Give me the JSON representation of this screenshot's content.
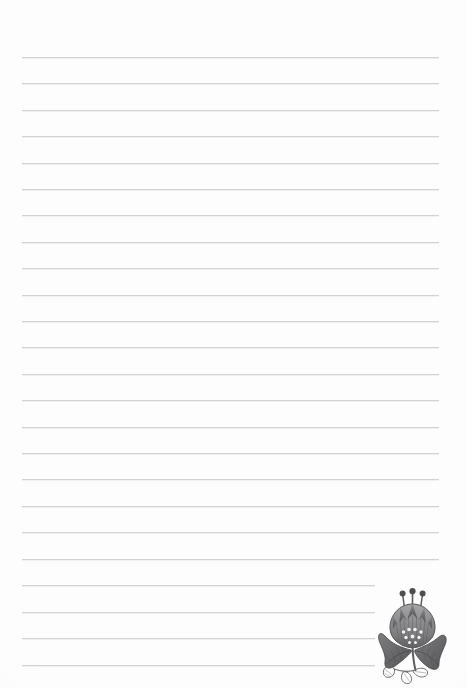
{
  "document": {
    "kind": "lined-notebook-paper",
    "title": "Lined Writing Paper",
    "background_color": "#fdfdfd",
    "width": 467,
    "height": 689
  },
  "rules": {
    "name": "horizontal-ruled-lines",
    "count": 24,
    "color": "#c9cbcd",
    "thickness": 1,
    "first_line_y": 57,
    "spacing": 26.4,
    "left_x": 22,
    "right_x": 439,
    "positions_y": [
      57,
      83,
      110,
      136,
      163,
      189,
      215,
      242,
      268,
      295,
      321,
      347,
      374,
      400,
      427,
      453,
      479,
      506,
      532,
      559,
      585,
      612,
      638,
      665
    ]
  },
  "ornament": {
    "name": "floral-tulip-illustration",
    "description": "Stylized grayscale tulip / carnation bloom with three stamens, two large curved leaves and a small leaf sprig",
    "ink_color": "#6f6f71",
    "ink_color_dark": "#4a4a4c",
    "ink_color_light": "#9a9a9c",
    "x": 376,
    "y": 586,
    "width": 74,
    "height": 100
  },
  "text": {
    "body_content": "",
    "header": "",
    "footer": ""
  }
}
